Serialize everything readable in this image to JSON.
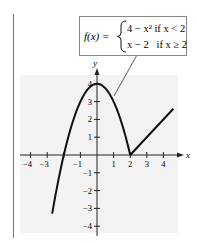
{
  "chart_data": {
    "type": "line",
    "title": "",
    "function_label": {
      "lhs": "f(x) =",
      "piece1": "4 − x² if x < 2",
      "piece2": "x − 2   if x ≥ 2"
    },
    "xlabel": "x",
    "ylabel": "y",
    "xlim": [
      -4.7,
      4.7
    ],
    "ylim": [
      -4.5,
      4.6
    ],
    "grid": false,
    "x_ticks": [
      -4,
      -3,
      -2,
      -1,
      1,
      2,
      3,
      4
    ],
    "x_tick_labels": [
      "−4",
      "−3",
      "",
      "−1",
      "1",
      "2",
      "3",
      "4"
    ],
    "y_ticks": [
      -4,
      -3,
      -2,
      -1,
      1,
      2,
      3,
      4
    ],
    "y_tick_labels": [
      "−4",
      "−3",
      "−2",
      "−1",
      "1",
      "2",
      "3",
      "4"
    ],
    "series": [
      {
        "name": "4 - x^2 (x < 2)",
        "x": [
          -2.7,
          -2,
          -1.5,
          -1,
          -0.5,
          0,
          0.5,
          1,
          1.5,
          2
        ],
        "values": [
          -3.29,
          0,
          1.75,
          3,
          3.75,
          4,
          3.75,
          3,
          1.75,
          0
        ]
      },
      {
        "name": "x - 2 (x >= 2)",
        "x": [
          2,
          4.6
        ],
        "values": [
          0,
          2.6
        ]
      }
    ],
    "annotations": [
      {
        "text": "callout from formula box to curve near x = 0.8",
        "target": [
          0.8,
          3.36
        ]
      }
    ],
    "colors": {
      "curve": "#111111",
      "axis": "#222222",
      "shading": "#f3f3f3",
      "frame": "#888888"
    }
  }
}
